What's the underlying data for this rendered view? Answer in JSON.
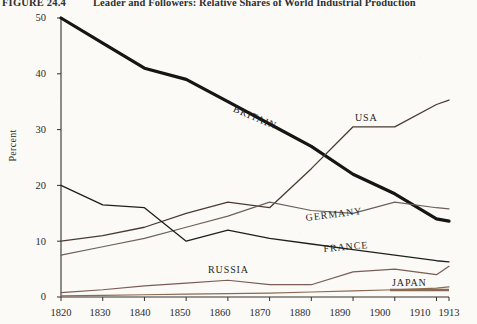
{
  "figure": {
    "label": "FIGURE 24.4",
    "title": "Leader and Followers: Relative Shares of World Industrial Production"
  },
  "chart_data": {
    "type": "line",
    "title": "Leader and Followers: Relative Shares of World Industrial Production",
    "xlabel": "",
    "ylabel": "Percent",
    "xlim": [
      1820,
      1913
    ],
    "ylim": [
      0,
      50
    ],
    "yticks": [
      0,
      10,
      20,
      30,
      40,
      50
    ],
    "xticks": [
      1820,
      1830,
      1840,
      1850,
      1860,
      1870,
      1880,
      1890,
      1900,
      1910,
      1913
    ],
    "grid": false,
    "legend": "inline-labels",
    "x": [
      1820,
      1830,
      1840,
      1850,
      1860,
      1870,
      1880,
      1890,
      1900,
      1910,
      1913
    ],
    "series": [
      {
        "name": "BRITAIN",
        "color": "#151515",
        "width": 3.2,
        "values": [
          50.0,
          45.5,
          41.0,
          39.0,
          35.0,
          31.0,
          27.0,
          22.0,
          18.5,
          14.0,
          13.6
        ]
      },
      {
        "name": "USA",
        "color": "#4a3a33",
        "width": 1.3,
        "values": [
          10.0,
          11.0,
          12.5,
          15.0,
          17.0,
          16.0,
          23.0,
          30.5,
          30.5,
          34.5,
          35.3
        ]
      },
      {
        "name": "GERMANY",
        "color": "#6d6058",
        "width": 1.2,
        "values": [
          7.5,
          9.0,
          10.5,
          12.5,
          14.5,
          17.0,
          15.5,
          15.0,
          17.0,
          16.0,
          15.8
        ]
      },
      {
        "name": "FRANCE",
        "color": "#1f1f1f",
        "width": 1.3,
        "values": [
          20.0,
          16.5,
          16.0,
          10.0,
          12.0,
          10.5,
          9.5,
          8.5,
          7.5,
          6.5,
          6.3
        ]
      },
      {
        "name": "RUSSIA",
        "color": "#7a5c55",
        "width": 1.2,
        "values": [
          0.8,
          1.3,
          2.0,
          2.5,
          3.0,
          2.2,
          2.2,
          4.5,
          5.0,
          4.0,
          5.5
        ]
      },
      {
        "name": "JAPAN",
        "color": "#8a6a52",
        "width": 1.2,
        "values": [
          0.2,
          0.3,
          0.4,
          0.5,
          0.6,
          0.7,
          0.9,
          1.1,
          1.3,
          1.6,
          1.8
        ]
      }
    ]
  },
  "axis": {
    "y_title": "Percent",
    "y_ticks": [
      "50",
      "40",
      "30",
      "20",
      "10",
      "0"
    ],
    "x_ticks": [
      "1820",
      "1830",
      "1840",
      "1850",
      "1860",
      "1870",
      "1880",
      "1890",
      "1900",
      "1910",
      "1913"
    ]
  },
  "labels": {
    "britain": "BRITAIN",
    "usa": "USA",
    "germany": "GERMANY",
    "france": "FRANCE",
    "russia": "RUSSIA",
    "japan": "JAPAN"
  }
}
